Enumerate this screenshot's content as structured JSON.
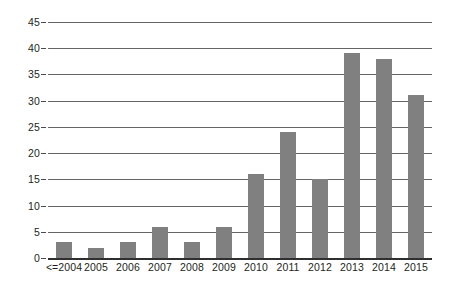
{
  "chart_data": {
    "type": "bar",
    "title": "",
    "subtitle": "",
    "xlabel": "",
    "ylabel": "",
    "categories": [
      "<=2004",
      "2005",
      "2006",
      "2007",
      "2008",
      "2009",
      "2010",
      "2011",
      "2012",
      "2013",
      "2014",
      "2015"
    ],
    "values": [
      3,
      2,
      3,
      6,
      3,
      6,
      16,
      24,
      15,
      39,
      38,
      31
    ],
    "ylim": [
      0,
      45
    ],
    "ytick_values": [
      0,
      5,
      10,
      15,
      20,
      25,
      30,
      35,
      40,
      45
    ],
    "ytick_labels": [
      "0",
      "5",
      "10",
      "15",
      "20",
      "25",
      "30",
      "35",
      "40",
      "45"
    ],
    "grid": true,
    "grid_axis": "y",
    "legend": false,
    "legend_position": "none",
    "bar_color": "#808080",
    "gridline_color": "#4a4a4a",
    "axis_color": "#2f2f2f",
    "text_color": "#231f20",
    "background_color": "#ffffff",
    "annotations": []
  }
}
